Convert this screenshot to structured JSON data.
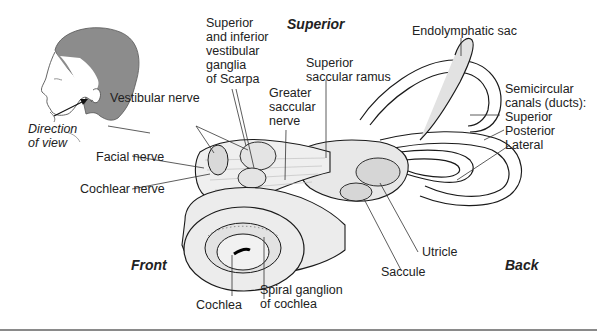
{
  "figure": {
    "orientation": {
      "superior": "Superior",
      "front": "Front",
      "back": "Back"
    },
    "inset": {
      "caption_line1": "Direction",
      "caption_line2": "of view"
    },
    "labels": {
      "vestibular_nerve": "Vestibular nerve",
      "facial_nerve": "Facial nerve",
      "cochlear_nerve": "Cochlear nerve",
      "ganglia": "Superior\nand inferior\nvestibular\nganglia\nof Scarpa",
      "greater_saccular_nerve": "Greater\nsaccular\nnerve",
      "superior_saccular_ramus": "Superior\nsaccular ramus",
      "endolymphatic_sac": "Endolymphatic sac",
      "semicircular_canals": "Semicircular\ncanals (ducts):",
      "superior_canal": "Superior",
      "posterior_canal": "Posterior",
      "lateral_canal": "Lateral",
      "utricle": "Utricle",
      "saccule": "Saccule",
      "cochlea": "Cochlea",
      "spiral_ganglion": "Spiral ganglion\nof cochlea"
    },
    "colors": {
      "outline": "#1a1a1a",
      "fill_light": "#ececec",
      "fill_mid": "#d4d4d4",
      "hair": "#8c8c8c",
      "leader": "#333333",
      "rule": "#8a8a8a"
    }
  }
}
